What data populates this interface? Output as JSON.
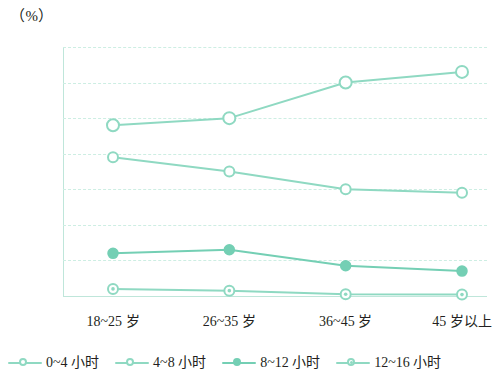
{
  "chart_data": {
    "type": "line",
    "title": "",
    "subtitle": "",
    "xlabel": "",
    "ylabel": "（%）",
    "unit_caption": "（%）",
    "categories": [
      "18~25 岁",
      "26~35 岁",
      "36~45 岁",
      "45 岁以上"
    ],
    "ylim": [
      0,
      70
    ],
    "ytick_values": [
      70,
      60,
      50,
      40,
      30,
      20,
      10,
      0
    ],
    "ytick_labels": [
      "70",
      "60",
      "50",
      "40",
      "30",
      "20",
      "10",
      "0"
    ],
    "grid": true,
    "grid_style": "dashed-horizontal",
    "legend_position": "bottom-left",
    "series": [
      {
        "name": "0~4 小时",
        "values": [
          39,
          35,
          30,
          29
        ],
        "color": "#8fd9c2",
        "marker": "open-circle"
      },
      {
        "name": "4~8 小时",
        "values": [
          48,
          50,
          60,
          63
        ],
        "color": "#8fd9c2",
        "marker": "open-circle-large"
      },
      {
        "name": "8~12 小时",
        "values": [
          12,
          13,
          8.5,
          7
        ],
        "color": "#74cfb4",
        "marker": "filled-circle"
      },
      {
        "name": "12~16 小时",
        "values": [
          2,
          1.5,
          0.5,
          0.4
        ],
        "color": "#8fd9c2",
        "marker": "circle-dot"
      }
    ]
  },
  "legend": {
    "items": [
      {
        "label": "0~4 小时"
      },
      {
        "label": "4~8 小时"
      },
      {
        "label": "8~12 小时"
      },
      {
        "label": "12~16 小时"
      }
    ]
  },
  "colors": {
    "line": "#8fd9c2",
    "line_dark": "#74cfb4",
    "grid": "#cdeee3",
    "axis": "#bfe6da",
    "text": "#231f20",
    "background": "#ffffff"
  }
}
